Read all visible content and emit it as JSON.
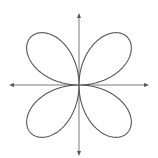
{
  "diagram": {
    "type": "polar-rose-curve",
    "petals": 4,
    "colors": {
      "background": "#ffffff",
      "axis": "#7a7a7a",
      "curve": "#555555"
    }
  },
  "chart_data": {
    "type": "line",
    "title": "",
    "xlabel": "",
    "ylabel": "",
    "equation": "r = sin(2θ)",
    "grid": false,
    "legend": null,
    "axes": {
      "arrows_both_ends": true,
      "tick_labels": []
    },
    "series": [
      {
        "name": "rose-curve",
        "petal_count": 4,
        "petal_directions_deg": [
          45,
          135,
          225,
          315
        ]
      }
    ]
  }
}
